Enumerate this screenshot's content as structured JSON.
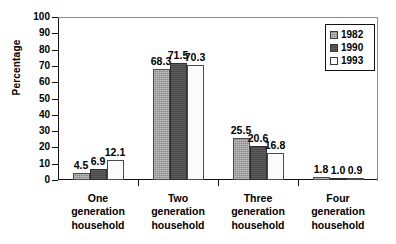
{
  "chart_data": {
    "type": "bar",
    "title": "",
    "xlabel": "",
    "ylabel": "Percentage",
    "ylim": [
      0,
      100
    ],
    "yticks": [
      0,
      10,
      20,
      30,
      40,
      50,
      60,
      70,
      80,
      90,
      100
    ],
    "ytick_labels": [
      "0",
      "10",
      "20",
      "30",
      "40",
      "50",
      "60",
      "70",
      "80",
      "90",
      "100"
    ],
    "grid": false,
    "legend_position": "top-right",
    "categories": [
      "One\ngeneration\nhousehold",
      "Two\ngeneration\nhousehold",
      "Three\ngeneration\nhousehold",
      "Four\ngeneration\nhousehold"
    ],
    "series": [
      {
        "name": "1982",
        "color": "#8a8a8a",
        "values": [
          4.5,
          68.3,
          25.5,
          1.8
        ],
        "value_labels": [
          "4.5",
          "68.3",
          "25.5",
          "1.8"
        ]
      },
      {
        "name": "1990",
        "color": "#4a4a4a",
        "values": [
          6.9,
          71.5,
          20.6,
          1.0
        ],
        "value_labels": [
          "6.9",
          "71.5",
          "20.6",
          "1.0"
        ]
      },
      {
        "name": "1993",
        "color": "#fbfbfb",
        "values": [
          12.1,
          70.3,
          16.8,
          0.9
        ],
        "value_labels": [
          "12.1",
          "70.3",
          "16.8",
          "0.9"
        ]
      }
    ]
  },
  "axis": {
    "y_title": "Percentage"
  },
  "legend": {
    "items": [
      {
        "label": "1982",
        "color": "#8a8a8a"
      },
      {
        "label": "1990",
        "color": "#4a4a4a"
      },
      {
        "label": "1993",
        "color": "#fbfbfb"
      }
    ]
  }
}
